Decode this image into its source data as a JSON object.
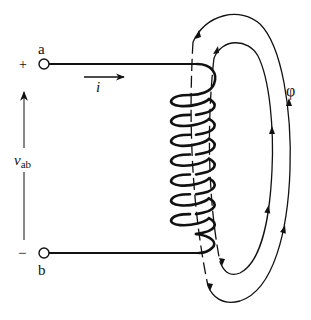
{
  "diagram": {
    "terminals": {
      "top": {
        "label": "a",
        "polarity": "+"
      },
      "bottom": {
        "label": "b",
        "polarity": "−"
      }
    },
    "current": {
      "symbol": "i",
      "direction": "right"
    },
    "voltage": {
      "symbol": "v",
      "subscript": "ab",
      "direction": "up"
    },
    "flux": {
      "symbol": "φ",
      "loops": 2,
      "direction_outside_coil": "up",
      "direction_inside_coil": "down"
    },
    "coil": {
      "turns": 8
    },
    "colors": {
      "ink": "#111111",
      "background": "#ffffff"
    }
  }
}
